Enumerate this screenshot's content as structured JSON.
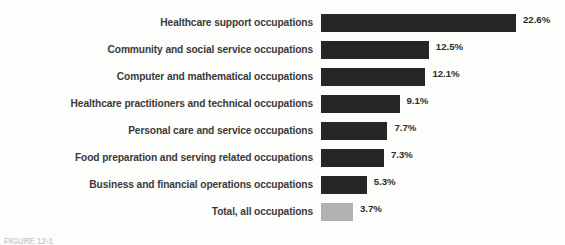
{
  "chart_data": {
    "type": "bar",
    "orientation": "horizontal",
    "title": "",
    "xlabel": "",
    "ylabel": "",
    "grid": false,
    "legend": false,
    "xlim": [
      0,
      22.6
    ],
    "value_suffix": "%",
    "categories": [
      "Healthcare support occupations",
      "Community and social service occupations",
      "Computer and mathematical occupations",
      "Healthcare practitioners and technical occupations",
      "Personal care and service occupations",
      "Food preparation and serving related occupations",
      "Business and financial operations occupations",
      "Total, all occupations"
    ],
    "values": [
      22.6,
      12.5,
      12.1,
      9.1,
      7.7,
      7.3,
      5.3,
      3.7
    ],
    "value_labels": [
      "22.6%",
      "12.5%",
      "12.1%",
      "9.1%",
      "7.7%",
      "7.3%",
      "5.3%",
      "3.7%"
    ],
    "bar_colors": [
      "#262626",
      "#262626",
      "#262626",
      "#262626",
      "#262626",
      "#262626",
      "#262626",
      "#b2b2b2"
    ],
    "highlight_color": "#b2b2b2",
    "series_color": "#262626"
  },
  "rows": [
    {
      "label": "Healthcare support occupations",
      "value": 22.6,
      "value_label": "22.6%",
      "accent": "dark"
    },
    {
      "label": "Community and social service occupations",
      "value": 12.5,
      "value_label": "12.5%",
      "accent": "dark"
    },
    {
      "label": "Computer and mathematical occupations",
      "value": 12.1,
      "value_label": "12.1%",
      "accent": "dark"
    },
    {
      "label": "Healthcare practitioners and technical occupations",
      "value": 9.1,
      "value_label": "9.1%",
      "accent": "dark"
    },
    {
      "label": "Personal care and service occupations",
      "value": 7.7,
      "value_label": "7.7%",
      "accent": "dark"
    },
    {
      "label": "Food preparation and serving related occupations",
      "value": 7.3,
      "value_label": "7.3%",
      "accent": "dark"
    },
    {
      "label": "Business and financial operations occupations",
      "value": 5.3,
      "value_label": "5.3%",
      "accent": "dark"
    },
    {
      "label": "Total, all occupations",
      "value": 3.7,
      "value_label": "3.7%",
      "accent": "light"
    }
  ],
  "caption": {
    "text": "FIGURE 12-1"
  },
  "colors": {
    "background": "#fdfdfb",
    "bar_dark": "#262626",
    "bar_light": "#b2b2b2",
    "label_text": "#3a3a3a",
    "value_text": "#2b2b2b"
  }
}
